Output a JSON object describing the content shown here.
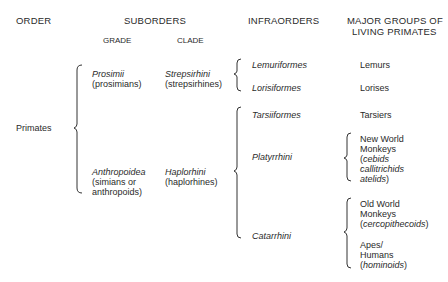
{
  "headers": {
    "order": "ORDER",
    "suborders": "SUBORDERS",
    "grade": "GRADE",
    "clade": "CLADE",
    "infraorders": "INFRAORDERS",
    "major_groups_line1": "MAJOR GROUPS OF",
    "major_groups_line2": "LIVING PRIMATES"
  },
  "order": {
    "name": "Primates"
  },
  "suborders": [
    {
      "grade": "Prosimii",
      "grade_common": [
        "(prosimians)"
      ],
      "clade": "Strepsirhini",
      "clade_common": "(strepsirhines)"
    },
    {
      "grade": "Anthropoidea",
      "grade_common": [
        "(simians or",
        "anthropoids)"
      ],
      "clade": "Haplorhini",
      "clade_common": "(haplorhines)"
    }
  ],
  "infraorders": [
    "Lemuriformes",
    "Lorisiformes",
    "Tarsiiformes",
    "Platyrrhini",
    "Catarrhini"
  ],
  "groups": {
    "lemurs": "Lemurs",
    "lorises": "Lorises",
    "tarsiers": "Tarsiers",
    "nwm": {
      "l1": "New World",
      "l2": "Monkeys",
      "open": "(",
      "l3": "cebids",
      "l4": "callitrichids",
      "l5": "atelids",
      "close": ")"
    },
    "owm": {
      "l1": "Old World",
      "l2": "Monkeys",
      "open": "(",
      "l3": "cercopithecoids",
      "close": ")"
    },
    "apes": {
      "l1": "Apes/",
      "l2": "Humans",
      "open": "(",
      "l3": "hominoids",
      "close": ")"
    }
  }
}
